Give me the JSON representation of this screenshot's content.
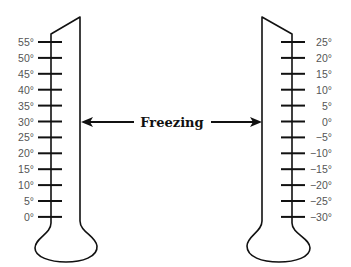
{
  "diagram": {
    "center_label": "Freezing",
    "left_thermometer": {
      "scale": "Fahrenheit-like (left)",
      "ticks": [
        "55°",
        "50°",
        "45°",
        "40°",
        "35°",
        "30°",
        "25°",
        "20°",
        "15°",
        "10°",
        "5°",
        "0°"
      ],
      "freezing_tick": "30°"
    },
    "right_thermometer": {
      "scale": "Celsius-like (right)",
      "ticks": [
        "25°",
        "20°",
        "15°",
        "10°",
        "5°",
        "0°",
        "−5°",
        "−10°",
        "−15°",
        "−20°",
        "−25°",
        "−30°"
      ],
      "freezing_tick": "0°"
    },
    "colors": {
      "line": "#111111",
      "label": "#555555"
    }
  }
}
